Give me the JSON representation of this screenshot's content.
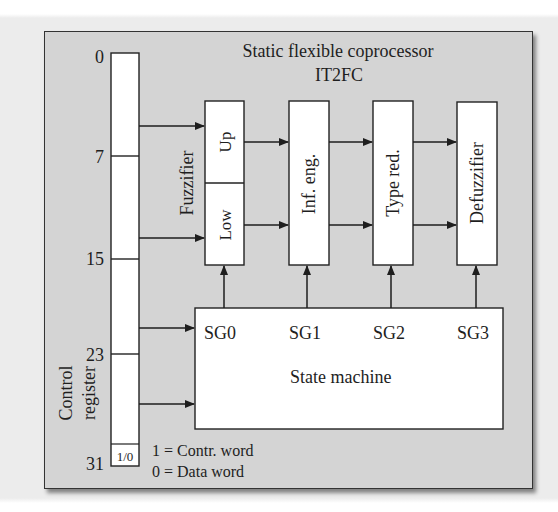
{
  "title": {
    "line1": "Static flexible coprocessor",
    "line2": "IT2FC"
  },
  "register": {
    "label_line1": "Control",
    "label_line2": "register",
    "bit_labels": [
      "0",
      "7",
      "15",
      "23",
      "31"
    ],
    "flag_cell": "1/0"
  },
  "legend": {
    "line1": "1 = Contr. word",
    "line2": "0 = Data word"
  },
  "fuzzifier": {
    "label": "Fuzzifier",
    "upper": "Up",
    "lower": "Low"
  },
  "blocks": {
    "inference": "Inf. eng.",
    "type_reduction": "Type red.",
    "defuzzifier": "Defuzzifier"
  },
  "state_machine": {
    "label": "State machine",
    "signals": [
      "SG0",
      "SG1",
      "SG2",
      "SG3"
    ]
  },
  "colors": {
    "frame_bg": "#d4d4d4",
    "block_bg": "#ffffff",
    "stroke": "#222222"
  }
}
